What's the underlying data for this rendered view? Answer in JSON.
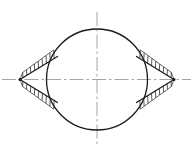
{
  "figure": {
    "kind": "engineering-line-drawing",
    "title": "",
    "canvas": {
      "width": 193,
      "height": 150,
      "background": "#ffffff"
    },
    "colors": {
      "outline": "#1a1a1a",
      "centerline": "#9a9a9a",
      "hatch": "#2b2b2b",
      "background": "#ffffff"
    },
    "stroke_widths": {
      "outline": 1.3,
      "wedge_edge": 1.3,
      "centerline": 0.9,
      "hatch": 0.8
    },
    "circle": {
      "label": "main-circle",
      "cx": 97,
      "cy": 79.5,
      "r": 50.5
    },
    "centerlines": {
      "style": "dash-dot",
      "dash_pattern": "14 3 2.5 3",
      "horizontal": {
        "label": "horizontal-centerline",
        "x1": 2,
        "y1": 79.5,
        "x2": 191,
        "y2": 79.5
      },
      "vertical": {
        "label": "vertical-centerline",
        "x1": 97,
        "y1": 12,
        "x2": 97,
        "y2": 147
      }
    },
    "wedges": [
      {
        "label": "left-wedge",
        "side": "left",
        "apex": {
          "x": 20,
          "y": 79.5
        },
        "upper_vertex": {
          "x": 57.5,
          "y": 56.5
        },
        "lower_vertex": {
          "x": 57.5,
          "y": 102.5
        },
        "hatch_ticks_upper": 9,
        "hatch_ticks_lower": 9,
        "hatch_length": 9
      },
      {
        "label": "right-wedge",
        "side": "right",
        "apex": {
          "x": 174,
          "y": 79.5
        },
        "upper_vertex": {
          "x": 136.5,
          "y": 56.5
        },
        "lower_vertex": {
          "x": 136.5,
          "y": 102.5
        },
        "hatch_ticks_upper": 9,
        "hatch_ticks_lower": 9,
        "hatch_length": 9
      }
    ],
    "annotations": {
      "dimension_labels": [],
      "notes": []
    }
  }
}
